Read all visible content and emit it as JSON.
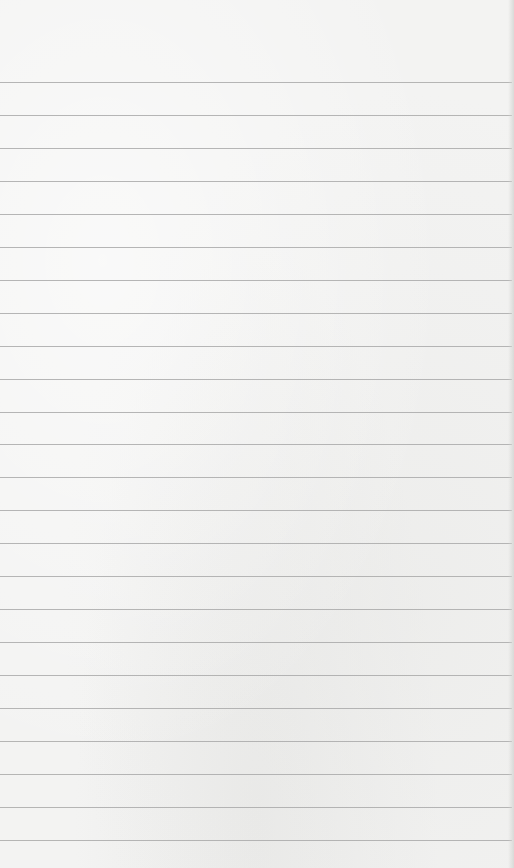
{
  "page": {
    "type": "lined-paper",
    "background_color": "#f3f3f2",
    "line_color": "#a9a9a9",
    "first_line_y": 82,
    "line_spacing": 32.95,
    "line_count": 24
  }
}
